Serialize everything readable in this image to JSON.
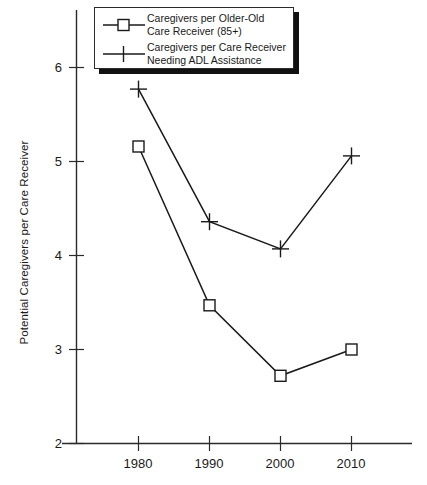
{
  "chart_data": {
    "type": "line",
    "title": "",
    "xlabel": "",
    "ylabel": "Potential Caregivers per Care Receiver",
    "x": [
      1980,
      1990,
      2000,
      2010
    ],
    "xtick_labels": [
      "1980",
      "1990",
      "2000",
      "2010"
    ],
    "ytick_labels": [
      "2",
      "3",
      "4",
      "5",
      "6"
    ],
    "ytick_values": [
      2,
      3,
      4,
      5,
      6
    ],
    "ylim": [
      2,
      6.45
    ],
    "xlim": [
      1975.5,
      2015.5
    ],
    "grid": false,
    "legend_position": "top-left",
    "series": [
      {
        "name": "Caregivers per Older-Old Care Receiver (85+)",
        "legend_line_1": "Caregivers per Older-Old",
        "legend_line_2": "Care Receiver (85+)",
        "marker": "square",
        "color": "#1a1a1a",
        "values": [
          5.16,
          3.47,
          2.72,
          3.0
        ]
      },
      {
        "name": "Caregivers per Care Receiver Needing ADL Assistance",
        "legend_line_1": "Caregivers per Care Receiver",
        "legend_line_2": "Needing ADL Assistance",
        "marker": "plus",
        "color": "#1a1a1a",
        "values": [
          5.77,
          4.36,
          4.07,
          5.06
        ]
      }
    ]
  },
  "axis": {
    "line_color": "#2a2a2a"
  }
}
